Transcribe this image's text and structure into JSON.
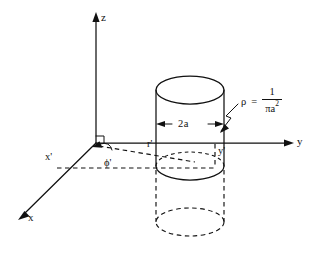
{
  "figure": {
    "background_color": "#ffffff",
    "ink_color": "#111111",
    "axes": {
      "z_label": "z",
      "y_label": "y",
      "x_label": "x"
    },
    "source_point_labels": {
      "x_prime": "x'",
      "y_prime": "y'",
      "r_prime": "r'",
      "phi_prime": "ϕ'"
    },
    "dimension": {
      "diameter_label": "2a"
    },
    "density": {
      "symbol": "ρ",
      "equals": "=",
      "numerator": "1",
      "denominator_base": "πa",
      "denominator_exponent": "2",
      "full_text": "ρ = 1/(πa²)"
    }
  }
}
